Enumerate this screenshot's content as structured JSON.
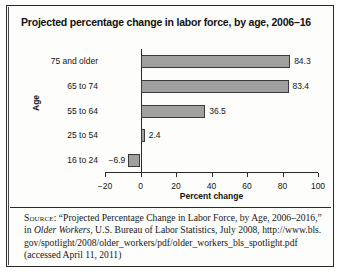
{
  "figure": {
    "title": "Projected percentage change in labor force, by age, 2006–16"
  },
  "chart_data": {
    "type": "bar",
    "orientation": "horizontal",
    "title": "Projected percentage change in labor force, by age, 2006–16",
    "xlabel": "Percent change",
    "ylabel": "Age",
    "categories": [
      "16 to 24",
      "25 to 54",
      "55 to 64",
      "65 to 74",
      "75 and older"
    ],
    "values": [
      -6.9,
      2.4,
      36.5,
      83.4,
      84.3
    ],
    "value_labels": [
      "−6.9",
      "2.4",
      "36.5",
      "83.4",
      "84.3"
    ],
    "xlim": [
      -20,
      100
    ],
    "xticks": [
      -20,
      0,
      20,
      40,
      60,
      80,
      100
    ],
    "xtick_labels": [
      "−20",
      "0",
      "20",
      "40",
      "60",
      "80",
      "100"
    ],
    "grid": false,
    "legend": false,
    "bar_color": "#a0a0a0",
    "bar_edge_color": "#3a3a3a"
  },
  "source": {
    "label": "Source:",
    "text_1": " “Projected Percentage Change in Labor Force, by Age, 2006–2016,” in ",
    "italic_1": "Older Workers",
    "text_2": ", U.S. Bureau of Labor Statistics, July 2008, ",
    "url": "http://www.bls.gov/spotlight/2008/older_workers/pdf/older_workers_bls_spotlight.pdf",
    "text_3": " (accessed April 11, 2011)"
  }
}
